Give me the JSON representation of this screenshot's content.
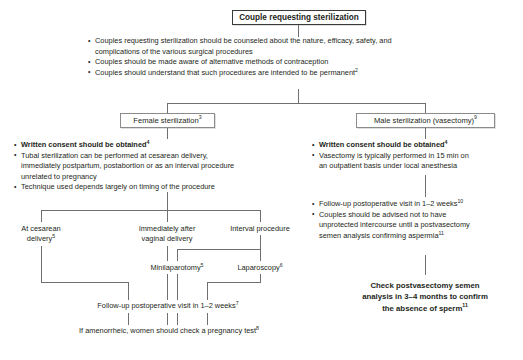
{
  "figure": {
    "type": "clinical-algorithm-flowchart",
    "title_box": {
      "label": "Couple requesting sterilization"
    },
    "top_counseling": {
      "items": [
        {
          "line1": "Couples requesting sterilization should be counseled about the nature, efficacy, safety, and",
          "line2": "complications of the various surgical procedures",
          "sup": "",
          "bold": false
        },
        {
          "line1": "Couples should be made aware of alternative methods of contraception",
          "line2": "",
          "sup": "",
          "bold": false
        },
        {
          "line1": "Couples should understand that such procedures are intended to be permanent",
          "line2": "",
          "sup": "2",
          "bold": false
        }
      ]
    },
    "branches": {
      "female": {
        "box_label": "Female sterilization",
        "box_sup": "3",
        "bullets": [
          {
            "line1": "Written consent should be obtained",
            "sup": "4",
            "bold": true,
            "lines": []
          },
          {
            "line1": "Tubal sterilization can be performed at cesarean delivery,",
            "sup": "",
            "bold": false,
            "lines": [
              "immediately postpartum, postabortion or as an interval procedure",
              "unrelated to pregnancy"
            ]
          },
          {
            "line1": "Technique used depends largely on timing of the procedure",
            "sup": "",
            "bold": false,
            "lines": []
          }
        ],
        "options": [
          {
            "line1": "At cesarean",
            "line2": "delivery",
            "sup": "5"
          },
          {
            "line1": "Immediately after",
            "line2": "vaginal delivery",
            "sup": ""
          },
          {
            "line1": "Interval procedure",
            "line2": "",
            "sup": ""
          }
        ],
        "methods": [
          {
            "label": "Minilaparotomy",
            "sup": "5"
          },
          {
            "label": "Laparoscopy",
            "sup": "6"
          }
        ],
        "followup": {
          "label": "Follow-up postoperative visit in 1–2 weeks",
          "sup": "7"
        },
        "pregnancy_test": {
          "label": "If amenorrheic, women should check a pregnancy test",
          "sup": "8"
        }
      },
      "male": {
        "box_label": "Male sterilization (vasectomy)",
        "box_sup": "9",
        "bullets": [
          {
            "line1": "Written consent should be obtained",
            "sup": "4",
            "bold": true,
            "lines": []
          },
          {
            "line1": "Vasectomy is typically performed in 15 min on",
            "sup": "",
            "bold": false,
            "lines": [
              "an outpatient basis under local anesthesia"
            ]
          }
        ],
        "bullets2": [
          {
            "line1": "Follow-up postoperative visit in 1–2 weeks",
            "sup": "10",
            "bold": false,
            "lines": []
          },
          {
            "line1": "Couples should be advised not to have",
            "sup": "",
            "bold": false,
            "lines": [
              "unprotected intercourse until a postvasectomy",
              "semen analysis confirming aspermia"
            ],
            "sup_last": "11"
          }
        ],
        "conclusion": {
          "line1": "Check postvasectomy semen",
          "line2": "analysis in 3–4 months to confirm",
          "line3": "the absence of sperm",
          "sup": "11"
        }
      }
    },
    "colors": {
      "text": "#231f20",
      "line": "#6f6f6f",
      "box_border": "#8b8b8b",
      "title_border": "#3a3a3a",
      "background": "#ffffff"
    }
  }
}
